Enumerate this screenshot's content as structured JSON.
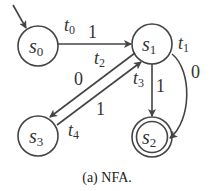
{
  "diagram": {
    "type": "nfa",
    "colors": {
      "stroke": "#444444",
      "text": "#333333",
      "background": "#ffffff"
    },
    "states": [
      {
        "id": "s0",
        "label": "s",
        "sub": "0",
        "initial": true,
        "accepting": false
      },
      {
        "id": "s1",
        "label": "s",
        "sub": "1",
        "initial": false,
        "accepting": false
      },
      {
        "id": "s2",
        "label": "s",
        "sub": "2",
        "initial": false,
        "accepting": true
      },
      {
        "id": "s3",
        "label": "s",
        "sub": "3",
        "initial": false,
        "accepting": false
      }
    ],
    "transitions": [
      {
        "id": "t0",
        "name": "t",
        "sub": "0",
        "from": "s0",
        "to": "s1",
        "symbol": "1"
      },
      {
        "id": "t1",
        "name": "t",
        "sub": "1",
        "from": "s1",
        "to": "s2",
        "symbol": "0"
      },
      {
        "id": "t2",
        "name": "t",
        "sub": "2",
        "from": "s1",
        "to": "s3",
        "symbol": "0"
      },
      {
        "id": "t3",
        "name": "t",
        "sub": "3",
        "from": "s1",
        "to": "s2",
        "symbol": "1"
      },
      {
        "id": "t4",
        "name": "t",
        "sub": "4",
        "from": "s3",
        "to": "s1",
        "symbol": "1"
      }
    ]
  },
  "caption": "(a) NFA."
}
